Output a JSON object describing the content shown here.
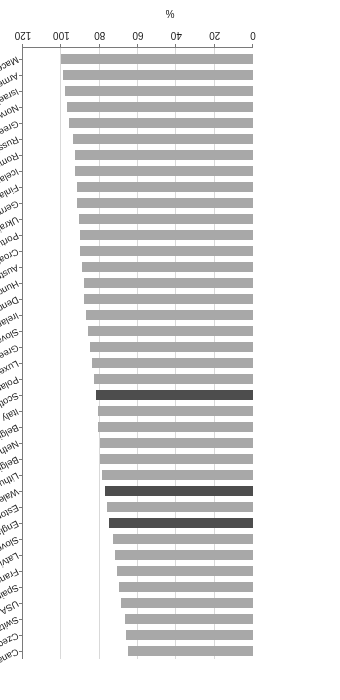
{
  "chart_data": {
    "type": "bar",
    "orientation": "horizontal",
    "title": "",
    "subtitle": "",
    "xlabel": "%",
    "ylabel": "",
    "xlim": [
      0,
      120
    ],
    "xticks": [
      0,
      20,
      40,
      60,
      80,
      100,
      120
    ],
    "xtick_labels": [
      "0",
      "20",
      "40",
      "60",
      "80",
      "100",
      "120"
    ],
    "grid": true,
    "legend": "none",
    "rotated_180": true,
    "colors": {
      "bar_default": "#a8a8a8",
      "bar_highlight": "#4d4d4d",
      "grid": "#d9d9d9",
      "axis": "#7a7a7a",
      "text": "#1a1a1a",
      "background": "#ffffff"
    },
    "highlighted_categories": [
      "Scotland",
      "Wales",
      "England"
    ],
    "categories": [
      "Canada",
      "Czech Republic",
      "Switzerland",
      "USA",
      "Spain",
      "France",
      "Latvia",
      "Slovenia",
      "England",
      "Estonia",
      "Wales",
      "Lithuania",
      "Belgium VLG",
      "Netherlands",
      "Belgium Wallonie",
      "Italy",
      "Scotland",
      "Poland",
      "Luxembourg",
      "Greenland",
      "Slovakia",
      "Ireland",
      "Denmark",
      "Hungary",
      "Austria",
      "Croatia",
      "Portugal",
      "Ukraine",
      "Germany",
      "Finland",
      "Iceland",
      "Romania",
      "Russia",
      "Greece",
      "Norway",
      "Israel",
      "Armenia",
      "Macedonia"
    ],
    "values": [
      65,
      66,
      67,
      69,
      70,
      71,
      72,
      73,
      75,
      76,
      77,
      79,
      80,
      80,
      81,
      81,
      82,
      83,
      84,
      85,
      86,
      87,
      88,
      88,
      89,
      90,
      90,
      91,
      92,
      92,
      93,
      93,
      94,
      96,
      97,
      98,
      99,
      100
    ]
  }
}
